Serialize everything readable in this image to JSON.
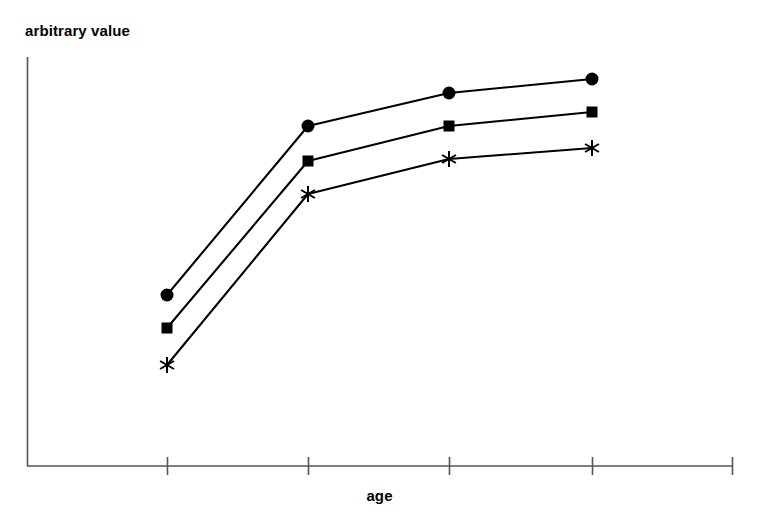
{
  "figure": {
    "background_color": "#ffffff",
    "ink_color": "#000000",
    "axis_color": "#555555",
    "width": 757,
    "height": 526
  },
  "labels": {
    "ylabel": "arbitrary value",
    "xlabel": "age"
  },
  "axes": {
    "y_axis": {
      "x": 27,
      "y_top": 57,
      "y_bottom": 466
    },
    "x_axis": {
      "y": 466,
      "x_left": 27,
      "x_right": 733
    },
    "x_ticks": [
      167,
      308,
      449,
      592
    ],
    "x_tick_half_length": 9,
    "end_cap_half_length": 9
  },
  "chart_data": {
    "type": "line",
    "title": "",
    "xlabel": "age",
    "ylabel": "arbitrary value",
    "x": [
      1,
      2,
      3,
      4
    ],
    "tick_labels": [
      "",
      "",
      "",
      ""
    ],
    "grid": false,
    "legend": "none",
    "axis_numeric_labels": false,
    "note": "Three unlabeled monotonically increasing curves; y axis is an arbitrary (unitless) scale with no tick labels. Values below are normalized 0-100 where 0 = x-axis baseline (y=466 px) and 100 = top of y-axis (y=57 px).",
    "series": [
      {
        "name": "circle-series",
        "marker": "filled-circle",
        "marker_size": 13,
        "values": [
          41.8,
          83.1,
          91.2,
          94.6
        ],
        "pixel_points": [
          {
            "x": 167,
            "y": 295
          },
          {
            "x": 308,
            "y": 126
          },
          {
            "x": 449,
            "y": 93
          },
          {
            "x": 592,
            "y": 79
          }
        ]
      },
      {
        "name": "square-series",
        "marker": "filled-square",
        "marker_size": 10,
        "values": [
          33.7,
          74.6,
          83.1,
          86.6
        ],
        "pixel_points": [
          {
            "x": 167,
            "y": 328
          },
          {
            "x": 308,
            "y": 161
          },
          {
            "x": 449,
            "y": 126
          },
          {
            "x": 592,
            "y": 112
          }
        ]
      },
      {
        "name": "asterisk-series",
        "marker": "six-point-asterisk",
        "marker_size": 15,
        "values": [
          24.7,
          66.5,
          75.1,
          77.8
        ],
        "pixel_points": [
          {
            "x": 167,
            "y": 365
          },
          {
            "x": 308,
            "y": 194
          },
          {
            "x": 449,
            "y": 159
          },
          {
            "x": 592,
            "y": 148
          }
        ]
      }
    ],
    "xlim": [
      0,
      5
    ],
    "ylim": [
      0,
      100
    ]
  }
}
